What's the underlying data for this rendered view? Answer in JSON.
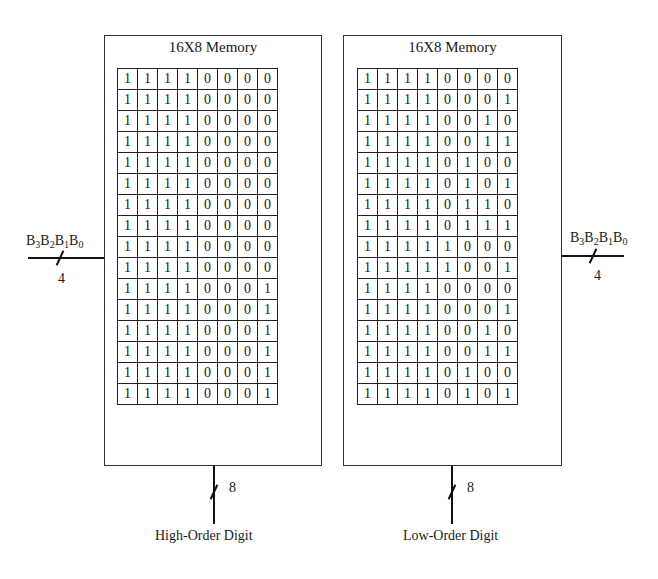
{
  "memories": [
    {
      "id": "high",
      "title": "16X8 Memory",
      "output_bus_width": "8",
      "output_label": "High-Order Digit",
      "rows": [
        [
          "1",
          "1",
          "1",
          "1",
          "0",
          "0",
          "0",
          "0"
        ],
        [
          "1",
          "1",
          "1",
          "1",
          "0",
          "0",
          "0",
          "0"
        ],
        [
          "1",
          "1",
          "1",
          "1",
          "0",
          "0",
          "0",
          "0"
        ],
        [
          "1",
          "1",
          "1",
          "1",
          "0",
          "0",
          "0",
          "0"
        ],
        [
          "1",
          "1",
          "1",
          "1",
          "0",
          "0",
          "0",
          "0"
        ],
        [
          "1",
          "1",
          "1",
          "1",
          "0",
          "0",
          "0",
          "0"
        ],
        [
          "1",
          "1",
          "1",
          "1",
          "0",
          "0",
          "0",
          "0"
        ],
        [
          "1",
          "1",
          "1",
          "1",
          "0",
          "0",
          "0",
          "0"
        ],
        [
          "1",
          "1",
          "1",
          "1",
          "0",
          "0",
          "0",
          "0"
        ],
        [
          "1",
          "1",
          "1",
          "1",
          "0",
          "0",
          "0",
          "0"
        ],
        [
          "1",
          "1",
          "1",
          "1",
          "0",
          "0",
          "0",
          "1"
        ],
        [
          "1",
          "1",
          "1",
          "1",
          "0",
          "0",
          "0",
          "1"
        ],
        [
          "1",
          "1",
          "1",
          "1",
          "0",
          "0",
          "0",
          "1"
        ],
        [
          "1",
          "1",
          "1",
          "1",
          "0",
          "0",
          "0",
          "1"
        ],
        [
          "1",
          "1",
          "1",
          "1",
          "0",
          "0",
          "0",
          "1"
        ],
        [
          "1",
          "1",
          "1",
          "1",
          "0",
          "0",
          "0",
          "1"
        ]
      ]
    },
    {
      "id": "low",
      "title": "16X8 Memory",
      "output_bus_width": "8",
      "output_label": "Low-Order Digit",
      "rows": [
        [
          "1",
          "1",
          "1",
          "1",
          "0",
          "0",
          "0",
          "0"
        ],
        [
          "1",
          "1",
          "1",
          "1",
          "0",
          "0",
          "0",
          "1"
        ],
        [
          "1",
          "1",
          "1",
          "1",
          "0",
          "0",
          "1",
          "0"
        ],
        [
          "1",
          "1",
          "1",
          "1",
          "0",
          "0",
          "1",
          "1"
        ],
        [
          "1",
          "1",
          "1",
          "1",
          "0",
          "1",
          "0",
          "0"
        ],
        [
          "1",
          "1",
          "1",
          "1",
          "0",
          "1",
          "0",
          "1"
        ],
        [
          "1",
          "1",
          "1",
          "1",
          "0",
          "1",
          "1",
          "0"
        ],
        [
          "1",
          "1",
          "1",
          "1",
          "0",
          "1",
          "1",
          "1"
        ],
        [
          "1",
          "1",
          "1",
          "1",
          "1",
          "0",
          "0",
          "0"
        ],
        [
          "1",
          "1",
          "1",
          "1",
          "1",
          "0",
          "0",
          "1"
        ],
        [
          "1",
          "1",
          "1",
          "1",
          "0",
          "0",
          "0",
          "0"
        ],
        [
          "1",
          "1",
          "1",
          "1",
          "0",
          "0",
          "0",
          "1"
        ],
        [
          "1",
          "1",
          "1",
          "1",
          "0",
          "0",
          "1",
          "0"
        ],
        [
          "1",
          "1",
          "1",
          "1",
          "0",
          "0",
          "1",
          "1"
        ],
        [
          "1",
          "1",
          "1",
          "1",
          "0",
          "1",
          "0",
          "0"
        ],
        [
          "1",
          "1",
          "1",
          "1",
          "0",
          "1",
          "0",
          "1"
        ]
      ]
    }
  ],
  "inputs": {
    "left": {
      "bits": [
        "B",
        "3",
        "B",
        "2",
        "B",
        "1",
        "B",
        "0"
      ],
      "bus_width": "4"
    },
    "right": {
      "bits": [
        "B",
        "3",
        "B",
        "2",
        "B",
        "1",
        "B",
        "0"
      ],
      "bus_width": "4"
    }
  }
}
